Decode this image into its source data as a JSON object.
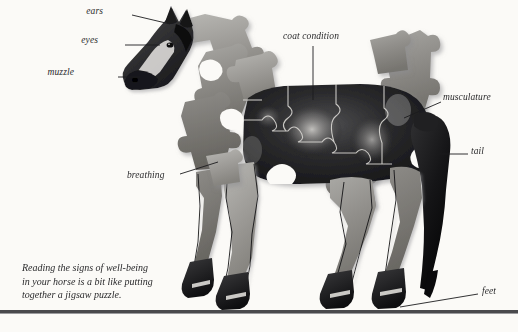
{
  "figure": {
    "subject": "horse",
    "style": "jigsaw-puzzle-photograph",
    "background_color": "#fbfaf7",
    "ground_rule_color": "#4a4a4d"
  },
  "labels": [
    {
      "id": "ears",
      "text": "ears",
      "x": 103,
      "y": 10,
      "align": "right",
      "leader": {
        "x1": 132,
        "y1": 15,
        "x2": 168,
        "y2": 24
      }
    },
    {
      "id": "eyes",
      "text": "eyes",
      "x": 98,
      "y": 39,
      "align": "right",
      "leader": {
        "x1": 125,
        "y1": 45,
        "x2": 152,
        "y2": 45
      }
    },
    {
      "id": "muzzle",
      "text": "muzzle",
      "x": 74,
      "y": 71,
      "align": "right",
      "leader": {
        "x1": 118,
        "y1": 77,
        "x2": 136,
        "y2": 77
      }
    },
    {
      "id": "coat-condition",
      "text": "coat condition",
      "x": 283,
      "y": 34,
      "align": "left",
      "leader": {
        "x1": 313,
        "y1": 45,
        "x2": 313,
        "y2": 99
      }
    },
    {
      "id": "musculature",
      "text": "musculature",
      "x": 443,
      "y": 95,
      "align": "left",
      "leader": {
        "x1": 441,
        "y1": 102,
        "x2": 406,
        "y2": 116
      }
    },
    {
      "id": "tail",
      "text": "tail",
      "x": 470,
      "y": 148,
      "align": "left",
      "leader": {
        "x1": 468,
        "y1": 154,
        "x2": 438,
        "y2": 154
      }
    },
    {
      "id": "feet",
      "text": "feet",
      "x": 480,
      "y": 288,
      "align": "left",
      "leader": {
        "x1": 478,
        "y1": 294,
        "x2": 443,
        "y2": 306
      }
    },
    {
      "id": "breathing",
      "text": "breathing",
      "x": 127,
      "y": 172,
      "align": "left",
      "leader": {
        "x1": 180,
        "y1": 176,
        "x2": 214,
        "y2": 166
      }
    }
  ],
  "caption": {
    "lines": [
      "Reading the signs of well-being",
      "in your horse is a bit like putting",
      "together a jigsaw puzzle."
    ]
  }
}
